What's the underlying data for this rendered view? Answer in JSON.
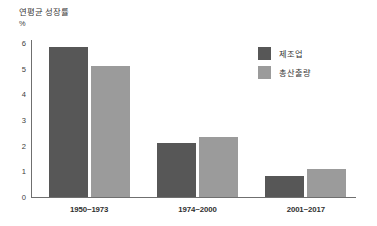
{
  "chart_data": {
    "type": "bar",
    "title": "연평균 성장률",
    "unit_label": "%",
    "xlabel": "",
    "ylabel": "",
    "ylim": [
      0,
      6
    ],
    "yticks": [
      0,
      1,
      2,
      3,
      4,
      5,
      6
    ],
    "ytick_labels": [
      "0",
      "1",
      "2",
      "3",
      "4",
      "5",
      "6"
    ],
    "grid": false,
    "legend_position": "top-right",
    "categories": [
      "1950~1973",
      "1974~2000",
      "2001~2017"
    ],
    "series": [
      {
        "name": "제조업",
        "color": "#575757",
        "values": [
          5.85,
          2.1,
          0.8
        ]
      },
      {
        "name": "총산출량",
        "color": "#9b9b9b",
        "values": [
          5.1,
          2.35,
          1.1
        ]
      }
    ]
  },
  "colors": {
    "series_manufacturing": "#575757",
    "series_total_output": "#9b9b9b",
    "axis": "#6f6f6f",
    "background": "#ffffff",
    "text": "#2f2f2f"
  }
}
